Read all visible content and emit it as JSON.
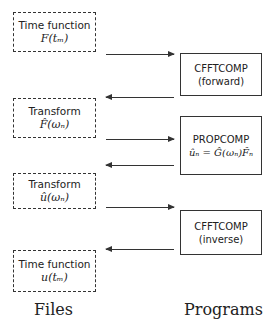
{
  "files": [
    {
      "title": "Time function",
      "expr": "F(tₘ)"
    },
    {
      "title": "Transform",
      "expr": "F̂(ωₙ)"
    },
    {
      "title": "Transform",
      "expr": "û(ωₙ)"
    },
    {
      "title": "Time function",
      "expr": "u(tₘ)"
    }
  ],
  "programs": [
    {
      "title": "CFFTCOMP",
      "subtitle": "(forward)"
    },
    {
      "title": "PROPCOMP",
      "subtitle": "ûₙ = Ĝ(ωₙ)F̂ₙ"
    },
    {
      "title": "CFFTCOMP",
      "subtitle": "(inverse)"
    }
  ],
  "arrows": [
    {
      "from": "Time function F(tₘ)",
      "to": "CFFTCOMP (forward)",
      "direction": "right"
    },
    {
      "from": "CFFTCOMP (forward)",
      "to": "Transform F̂(ωₙ)",
      "direction": "left"
    },
    {
      "from": "Transform F̂(ωₙ)",
      "to": "PROPCOMP",
      "direction": "right"
    },
    {
      "from": "PROPCOMP",
      "to": "Transform û(ωₙ)",
      "direction": "left"
    },
    {
      "from": "Transform û(ωₙ)",
      "to": "CFFTCOMP (inverse)",
      "direction": "right"
    },
    {
      "from": "CFFTCOMP (inverse)",
      "to": "Time function u(tₘ)",
      "direction": "left"
    }
  ],
  "labels": {
    "files": "Files",
    "programs": "Programs"
  }
}
